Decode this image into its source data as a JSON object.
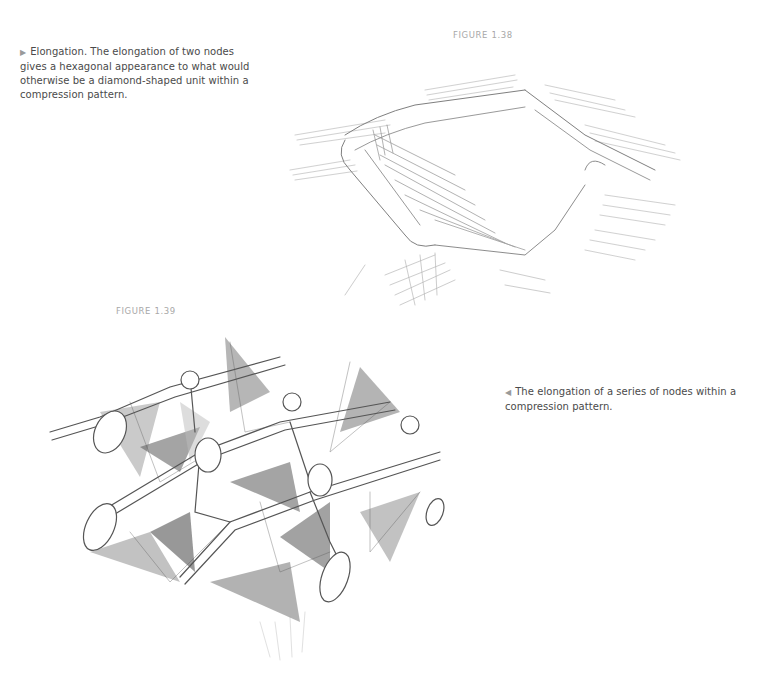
{
  "figures": [
    {
      "label": "FIGURE 1.38",
      "caption_marker": "▶",
      "caption": "Elongation. The elongation of two nodes gives a hexagonal appearance to what would otherwise be a diamond-shaped unit within a compression pattern.",
      "caption_lines": [
        "Elongation. The elongation of two nodes",
        "gives a hexagonal appearance to what would",
        "otherwise be a diamond-shaped unit within a",
        "compression pattern."
      ],
      "image": "pencil-sketch-hexagonal-unit"
    },
    {
      "label": "FIGURE 1.39",
      "caption_marker": "◀",
      "caption": "The elongation of a series of nodes within a compression pattern.",
      "caption_lines": [
        "The elongation of a series of nodes within a",
        "compression pattern."
      ],
      "image": "pencil-sketch-elongated-node-lattice"
    }
  ],
  "colors": {
    "text": "#4a4a4a",
    "marker": "#9a9a9a",
    "label": "#a8a8a8",
    "pencil": "#555555",
    "background": "#ffffff"
  }
}
